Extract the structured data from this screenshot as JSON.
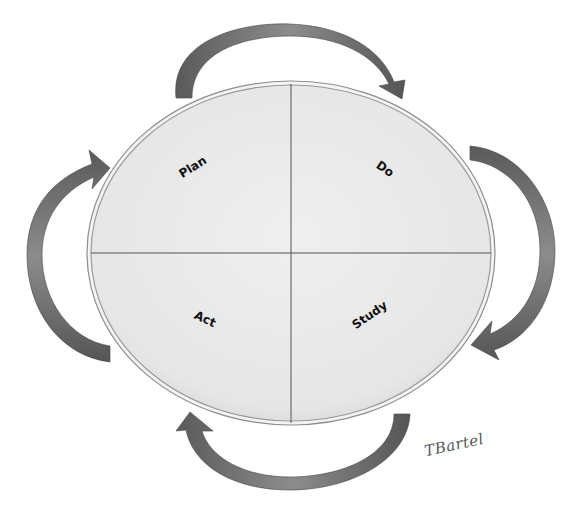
{
  "diagram": {
    "type": "PDSA cycle",
    "quadrants": [
      {
        "id": "plan",
        "label": "Plan",
        "position": "top-left"
      },
      {
        "id": "do",
        "label": "Do",
        "position": "top-right"
      },
      {
        "id": "study",
        "label": "Study",
        "position": "bottom-right"
      },
      {
        "id": "act",
        "label": "Act",
        "position": "bottom-left"
      }
    ],
    "arrows": [
      {
        "id": "arrow-top",
        "direction": "clockwise",
        "from": "plan",
        "to": "do"
      },
      {
        "id": "arrow-right",
        "direction": "clockwise",
        "from": "do",
        "to": "study"
      },
      {
        "id": "arrow-bottom",
        "direction": "clockwise",
        "from": "study",
        "to": "act"
      },
      {
        "id": "arrow-left",
        "direction": "clockwise",
        "from": "act",
        "to": "plan"
      }
    ],
    "signature": "TBartel",
    "colors": {
      "ellipse_fill": "#e9e9e9",
      "ellipse_border": "#9a9a9a",
      "divider": "#555555",
      "arrow_dark": "#4a4a4a",
      "arrow_light": "#8a8a8a",
      "label": "#111111"
    }
  }
}
